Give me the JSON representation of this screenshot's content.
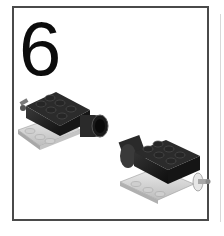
{
  "step": {
    "number": "6"
  },
  "illustration": {
    "parts": [
      {
        "name": "left-assembly",
        "description": "black 2x3 brick with axle pin and cylinder on light gray plate"
      },
      {
        "name": "right-assembly",
        "description": "black 2x3 brick with cylinder and axle on light gray plate"
      }
    ]
  },
  "colors": {
    "frame_border": "#4a4a4a",
    "brick": "#1e1e1e",
    "plate": "#d9d9d9",
    "background": "#ffffff"
  }
}
